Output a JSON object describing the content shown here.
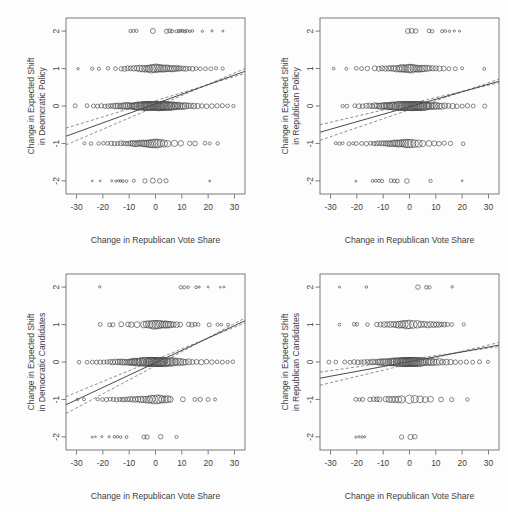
{
  "figure": {
    "width": 508,
    "height": 512,
    "background": "#fdfdfd",
    "layout": "2x2 grid of scatter plots with linear fit and confidence bands",
    "point_color": "#3f3f3f",
    "line_color": "#4a4a4a",
    "ci_color": "#6b6b6b"
  },
  "chart_data": [
    {
      "id": "panel-top-left",
      "type": "scatter",
      "title": "",
      "xlabel": "Change in Republican Vote Share",
      "ylabel": "Change in Expected Shift\nin Deomcratic Policy",
      "ylabel_line1": "Change in Expected Shift",
      "ylabel_line2": "in Deomcratic Policy",
      "xlim": [
        -34,
        34
      ],
      "ylim": [
        -2.35,
        2.35
      ],
      "xticks": [
        -30,
        -20,
        -10,
        0,
        10,
        20,
        30
      ],
      "xticklabels": [
        "-30",
        "-20",
        "-10",
        "0",
        "10",
        "20",
        "30"
      ],
      "yticks": [
        -2,
        -1,
        0,
        1,
        2
      ],
      "yticklabels": [
        "-2",
        "-1",
        "0",
        "1",
        "2"
      ],
      "grid": false,
      "legend": "none",
      "fit": {
        "intercept": 0.06,
        "slope": 0.0255
      },
      "ci_upper": {
        "intercept": 0.14,
        "slope": 0.0215
      },
      "ci_lower": {
        "intercept": -0.02,
        "slope": 0.03
      },
      "rows": [
        {
          "y": 2,
          "x": [
            -9.5,
            -8.4,
            -7.2,
            -1.0,
            4.2,
            5.4,
            6.3,
            8.0,
            8.9,
            9.6,
            10.4,
            11.2,
            12.0,
            13.1,
            14.0,
            17.8,
            21.5,
            25.6
          ]
        },
        {
          "y": 1,
          "x": [
            -29.4,
            -24.0,
            -21.5,
            -18.0,
            -15.2,
            -13.0,
            -11.8,
            -10.6,
            -9.4,
            -8.2,
            -7.0,
            -6.0,
            -5.0,
            -4.0,
            -3.2,
            -2.4,
            -1.6,
            -0.8,
            0.0,
            0.8,
            1.6,
            2.4,
            3.2,
            4.0,
            4.8,
            5.6,
            6.4,
            7.2,
            8.0,
            8.8,
            9.6,
            10.6,
            11.6,
            12.8,
            14.0,
            15.4,
            17.0,
            19.0,
            21.0,
            23.0,
            25.5
          ]
        },
        {
          "y": 0,
          "x": [
            -30.5,
            -26.0,
            -23.6,
            -22.0,
            -20.6,
            -19.2,
            -18.0,
            -17.0,
            -16.0,
            -15.0,
            -14.2,
            -13.4,
            -12.6,
            -11.8,
            -11.0,
            -10.3,
            -9.6,
            -9.0,
            -8.4,
            -7.8,
            -7.2,
            -6.6,
            -6.0,
            -5.5,
            -5.0,
            -4.5,
            -4.0,
            -3.6,
            -3.2,
            -2.8,
            -2.4,
            -2.0,
            -1.6,
            -1.2,
            -0.8,
            -0.4,
            0.0,
            0.4,
            0.8,
            1.2,
            1.6,
            2.0,
            2.4,
            2.8,
            3.2,
            3.6,
            4.0,
            4.5,
            5.0,
            5.5,
            6.0,
            6.6,
            7.2,
            7.8,
            8.4,
            9.0,
            9.8,
            10.6,
            11.4,
            12.4,
            13.4,
            14.6,
            16.0,
            17.6,
            19.4,
            21.4,
            23.4,
            25.4,
            27.4,
            29.6
          ]
        },
        {
          "y": -1,
          "x": [
            -27.0,
            -24.5,
            -21.6,
            -19.8,
            -18.2,
            -16.8,
            -15.6,
            -14.4,
            -13.2,
            -12.2,
            -11.2,
            -10.2,
            -9.4,
            -8.6,
            -7.8,
            -7.0,
            -6.2,
            -5.4,
            -4.6,
            -3.8,
            -3.0,
            -2.2,
            -1.4,
            -0.6,
            0.2,
            1.0,
            2.0,
            3.2,
            4.6,
            7.2,
            9.6,
            13.0,
            15.0,
            18.8,
            20.6,
            23.6
          ]
        },
        {
          "y": -2,
          "x": [
            -24.0,
            -21.0,
            -16.6,
            -15.0,
            -14.0,
            -13.2,
            -12.4,
            -11.0,
            -8.2,
            -4.0,
            -1.0,
            1.6,
            4.0,
            20.6
          ]
        }
      ],
      "point_sizes_note": "open circles, radius proportional to count, largest near x=0"
    },
    {
      "id": "panel-top-right",
      "type": "scatter",
      "title": "",
      "xlabel": "Change in Republican Vote Share",
      "ylabel_line1": "Change in Expected Shift",
      "ylabel_line2": "in Republican Policy",
      "xlim": [
        -34,
        34
      ],
      "ylim": [
        -2.35,
        2.35
      ],
      "xticks": [
        -30,
        -20,
        -10,
        0,
        10,
        20,
        30
      ],
      "xticklabels": [
        "-30",
        "-20",
        "-10",
        "0",
        "10",
        "20",
        "30"
      ],
      "yticks": [
        -2,
        -1,
        0,
        1,
        2
      ],
      "yticklabels": [
        "-2",
        "-1",
        "0",
        "1",
        "2"
      ],
      "grid": false,
      "legend": "none",
      "fit": {
        "intercept": -0.02,
        "slope": 0.02
      },
      "ci_upper": {
        "intercept": 0.06,
        "slope": 0.0165
      },
      "ci_lower": {
        "intercept": -0.1,
        "slope": 0.024
      },
      "rows": [
        {
          "y": 2,
          "x": [
            -0.6,
            0.8,
            2.4,
            7.4,
            8.6,
            12.4,
            13.6,
            15.2,
            17.0,
            19.0
          ]
        },
        {
          "y": 1,
          "x": [
            -28.8,
            -24.0,
            -20.2,
            -18.2,
            -16.0,
            -13.2,
            -11.6,
            -10.4,
            -9.2,
            -8.0,
            -7.0,
            -6.0,
            -5.0,
            -4.0,
            -3.2,
            -2.4,
            -1.6,
            -0.8,
            0.0,
            0.8,
            1.6,
            2.4,
            3.2,
            4.0,
            4.8,
            5.6,
            6.6,
            7.6,
            8.8,
            10.0,
            11.4,
            13.0,
            15.0,
            17.4,
            20.0,
            28.4
          ]
        },
        {
          "y": 0,
          "x": [
            -25.4,
            -23.8,
            -20.8,
            -19.2,
            -17.8,
            -16.4,
            -15.2,
            -14.2,
            -13.2,
            -12.4,
            -11.6,
            -10.8,
            -10.0,
            -9.4,
            -8.8,
            -8.2,
            -7.6,
            -7.0,
            -6.4,
            -5.8,
            -5.2,
            -4.6,
            -4.0,
            -3.5,
            -3.0,
            -2.5,
            -2.0,
            -1.6,
            -1.2,
            -0.8,
            -0.4,
            0.0,
            0.4,
            0.8,
            1.2,
            1.6,
            2.0,
            2.4,
            2.8,
            3.2,
            3.6,
            4.0,
            4.4,
            4.8,
            5.4,
            6.0,
            6.6,
            7.2,
            7.8,
            8.6,
            9.4,
            10.2,
            11.2,
            12.2,
            13.4,
            14.8,
            16.4,
            18.0,
            20.0,
            22.0,
            24.2,
            28.6
          ]
        },
        {
          "y": -1,
          "x": [
            -28.0,
            -26.6,
            -25.4,
            -23.0,
            -21.4,
            -20.2,
            -18.2,
            -16.4,
            -14.8,
            -13.6,
            -12.6,
            -11.6,
            -10.6,
            -9.8,
            -9.0,
            -8.2,
            -7.4,
            -6.6,
            -5.8,
            -5.0,
            -4.2,
            -3.4,
            -2.6,
            -1.8,
            -1.0,
            -0.2,
            0.8,
            2.0,
            3.4,
            5.0,
            7.4,
            9.4,
            11.2,
            13.2,
            15.6,
            20.4
          ]
        },
        {
          "y": -2,
          "x": [
            -20.4,
            -14.0,
            -12.8,
            -11.6,
            -10.4,
            -7.0,
            -5.8,
            -4.6,
            -1.0,
            8.0,
            20.0
          ]
        }
      ]
    },
    {
      "id": "panel-bottom-left",
      "type": "scatter",
      "title": "",
      "xlabel": "Change in Republican Vote Share",
      "ylabel_line1": "Change in Expected Shift",
      "ylabel_line2": "in Democratic Candidates",
      "xlim": [
        -34,
        34
      ],
      "ylim": [
        -2.35,
        2.35
      ],
      "xticks": [
        -30,
        -20,
        -10,
        0,
        10,
        20,
        30
      ],
      "xticklabels": [
        "-30",
        "-20",
        "-10",
        "0",
        "10",
        "20",
        "30"
      ],
      "yticks": [
        -2,
        -1,
        0,
        1,
        2
      ],
      "yticklabels": [
        "-2",
        "-1",
        "0",
        "1",
        "2"
      ],
      "grid": false,
      "legend": "none",
      "fit": {
        "intercept": -0.02,
        "slope": 0.033
      },
      "ci_upper": {
        "intercept": 0.06,
        "slope": 0.029
      },
      "ci_lower": {
        "intercept": -0.1,
        "slope": 0.0375
      },
      "rows": [
        {
          "y": 2,
          "x": [
            -21.2,
            9.6,
            11.0,
            12.4,
            15.4,
            16.6,
            20.0,
            24.6,
            26.0
          ]
        },
        {
          "y": 1,
          "x": [
            -21.0,
            -17.4,
            -16.2,
            -13.0,
            -10.4,
            -9.2,
            -7.0,
            -4.4,
            -3.4,
            -2.4,
            -1.4,
            -0.6,
            0.2,
            1.0,
            1.8,
            2.6,
            3.4,
            4.2,
            5.0,
            5.8,
            6.8,
            8.0,
            9.4,
            12.6,
            13.8,
            15.0,
            16.2,
            20.4,
            23.6,
            25.0,
            27.6
          ]
        },
        {
          "y": 0,
          "x": [
            -29.0,
            -26.0,
            -24.0,
            -22.4,
            -21.0,
            -19.6,
            -18.4,
            -17.2,
            -16.2,
            -15.2,
            -14.2,
            -13.4,
            -12.6,
            -11.8,
            -11.0,
            -10.2,
            -9.6,
            -9.0,
            -8.4,
            -7.8,
            -7.2,
            -6.6,
            -6.0,
            -5.4,
            -4.8,
            -4.2,
            -3.6,
            -3.0,
            -2.6,
            -2.2,
            -1.8,
            -1.4,
            -1.0,
            -0.6,
            -0.2,
            0.2,
            0.6,
            1.0,
            1.4,
            1.8,
            2.2,
            2.6,
            3.0,
            3.6,
            4.2,
            4.8,
            5.4,
            6.0,
            6.8,
            7.6,
            8.4,
            9.4,
            10.4,
            11.4,
            12.6,
            14.0,
            15.6,
            17.4,
            19.4,
            21.4,
            23.4,
            25.4,
            27.4,
            29.4
          ]
        },
        {
          "y": -1,
          "x": [
            -29.6,
            -27.2,
            -22.0,
            -20.2,
            -18.6,
            -17.2,
            -16.0,
            -14.8,
            -13.6,
            -12.6,
            -11.6,
            -10.6,
            -9.6,
            -8.6,
            -7.6,
            -6.6,
            -5.6,
            -4.6,
            -3.6,
            -2.6,
            -1.6,
            -0.6,
            0.6,
            1.6,
            2.6,
            3.6,
            4.6,
            5.6,
            10.4,
            15.0,
            17.0,
            20.0,
            22.6
          ]
        },
        {
          "y": -2,
          "x": [
            -24.0,
            -22.8,
            -20.4,
            -17.6,
            -15.6,
            -14.4,
            -13.2,
            -11.0,
            -4.4,
            -3.2,
            2.0,
            8.0
          ]
        }
      ]
    },
    {
      "id": "panel-bottom-right",
      "type": "scatter",
      "title": "",
      "xlabel": "Change in Republican Vote Share",
      "ylabel_line1": "Change in Expected Shift",
      "ylabel_line2": "in Republican Candidates",
      "xlim": [
        -34,
        34
      ],
      "ylim": [
        -2.35,
        2.35
      ],
      "xticks": [
        -30,
        -20,
        -10,
        0,
        10,
        20,
        30
      ],
      "xticklabels": [
        "-30",
        "-20",
        "-10",
        "0",
        "10",
        "20",
        "30"
      ],
      "yticks": [
        -2,
        -1,
        0,
        1,
        2
      ],
      "yticklabels": [
        "-2",
        "-1",
        "0",
        "1",
        "2"
      ],
      "grid": false,
      "legend": "none",
      "fit": {
        "intercept": 0.01,
        "slope": 0.013
      },
      "ci_upper": {
        "intercept": 0.07,
        "slope": 0.01
      },
      "ci_lower": {
        "intercept": -0.05,
        "slope": 0.0168
      },
      "rows": [
        {
          "y": 2,
          "x": [
            -26.6,
            -16.4,
            3.2,
            6.4,
            7.6,
            16.2
          ]
        },
        {
          "y": 1,
          "x": [
            -26.6,
            -21.0,
            -20.0,
            -16.0,
            -12.4,
            -11.0,
            -9.6,
            -8.4,
            -7.2,
            -6.0,
            -5.0,
            -4.0,
            -3.0,
            -2.0,
            -1.0,
            0.0,
            1.4,
            3.0,
            4.4,
            5.6,
            6.8,
            8.0,
            9.2,
            10.2,
            11.2,
            12.2,
            13.2,
            14.4,
            16.0,
            20.6
          ]
        },
        {
          "y": 0,
          "x": [
            -30.6,
            -28.0,
            -24.6,
            -22.6,
            -21.0,
            -19.6,
            -18.4,
            -17.2,
            -16.0,
            -15.0,
            -14.0,
            -13.0,
            -12.0,
            -11.2,
            -10.4,
            -9.6,
            -8.8,
            -8.0,
            -7.2,
            -6.6,
            -6.0,
            -5.4,
            -4.8,
            -4.2,
            -3.6,
            -3.0,
            -2.6,
            -2.2,
            -1.8,
            -1.4,
            -1.0,
            -0.6,
            -0.2,
            0.2,
            0.6,
            1.0,
            1.4,
            1.8,
            2.2,
            2.6,
            3.2,
            3.8,
            4.4,
            5.0,
            5.8,
            6.6,
            7.4,
            8.2,
            9.2,
            10.2,
            11.4,
            12.6,
            14.0,
            15.6,
            17.4,
            19.4,
            21.6,
            24.0,
            26.6,
            29.8
          ]
        },
        {
          "y": -1,
          "x": [
            -20.4,
            -19.0,
            -17.8,
            -15.0,
            -13.6,
            -12.4,
            -11.4,
            -9.0,
            -7.8,
            -6.6,
            -5.4,
            -4.2,
            -3.0,
            0.0,
            2.0,
            4.0,
            6.0,
            8.0,
            12.0,
            16.0,
            22.0
          ]
        },
        {
          "y": -2,
          "x": [
            -20.4,
            -19.2,
            -18.0,
            -17.0,
            -3.0,
            0.4,
            2.0
          ]
        }
      ]
    }
  ]
}
